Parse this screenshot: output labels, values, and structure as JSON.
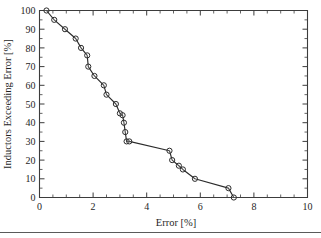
{
  "figure": {
    "background_color": "#ffffff",
    "frame_color": "#3c3c3c",
    "line_color": "#2b2b2b",
    "marker_color": "#2b2b2b"
  },
  "axes": {
    "x_title": "Error [%]",
    "y_title": "Inductors Exceeding Error [%]",
    "x_ticklabels": [
      "0",
      "2",
      "4",
      "6",
      "8",
      "10"
    ],
    "y_ticklabels": [
      "0",
      "10",
      "20",
      "30",
      "40",
      "50",
      "60",
      "70",
      "80",
      "90",
      "100"
    ]
  },
  "chart_data": {
    "type": "line",
    "title": "",
    "subtitle": "",
    "xlabel": "Error [%]",
    "ylabel": "Inductors Exceeding Error [%]",
    "xlim": [
      0,
      10
    ],
    "ylim": [
      0,
      100
    ],
    "xticks": [
      0,
      2,
      4,
      6,
      8,
      10
    ],
    "yticks": [
      0,
      10,
      20,
      30,
      40,
      50,
      60,
      70,
      80,
      90,
      100
    ],
    "x_minor_tick_interval": 0.5,
    "y_minor_tick_interval": 5,
    "grid": false,
    "legend": null,
    "legend_position": "none",
    "marker": "circle-open",
    "annotations": [],
    "series": [
      {
        "name": "Cumulative error distribution",
        "x": [
          0.26,
          0.55,
          0.95,
          1.35,
          1.55,
          1.78,
          1.82,
          2.05,
          2.4,
          2.5,
          2.85,
          3.0,
          3.1,
          3.15,
          3.2,
          3.25,
          3.35,
          4.85,
          4.95,
          5.2,
          5.35,
          5.8,
          7.05,
          7.25
        ],
        "y": [
          100,
          95,
          90,
          85,
          80,
          76,
          70,
          65,
          60,
          55,
          50,
          45,
          44,
          40,
          35,
          30,
          30,
          25,
          20,
          17,
          15,
          10,
          5,
          0
        ]
      }
    ]
  }
}
